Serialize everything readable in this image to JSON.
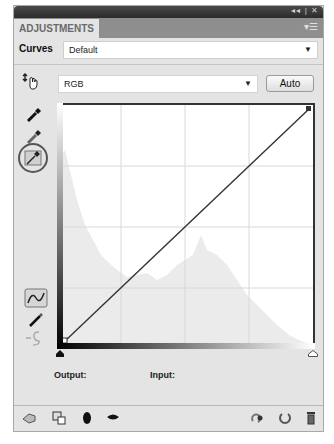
{
  "window": {
    "controls": "◂◂ | ✕"
  },
  "tabs": [
    {
      "label": "ADJUSTMENTS",
      "active": true
    }
  ],
  "tab_menu_icon": "▾☰",
  "preset": {
    "label": "Curves",
    "value": "Default"
  },
  "channel": {
    "value": "RGB"
  },
  "auto_button": {
    "label": "Auto"
  },
  "tools": [
    {
      "name": "on-image-adjust-hand-icon"
    },
    {
      "name": "black-point-eyedropper-icon"
    },
    {
      "name": "gray-point-eyedropper-icon"
    },
    {
      "name": "white-point-eyedropper-icon",
      "selected": true
    },
    {
      "name": "edit-points-curve-icon",
      "selected": true
    },
    {
      "name": "draw-pencil-icon"
    },
    {
      "name": "smooth-curve-icon",
      "disabled": true
    }
  ],
  "curve": {
    "start": [
      0,
      0
    ],
    "end": [
      255,
      255
    ],
    "grid_divisions": 4
  },
  "labels": {
    "output": "Output:",
    "input": "Input:"
  },
  "footer_icons": [
    "back-arrow-icon",
    "clip-to-layer-icon",
    "visibility-toggle-icon",
    "view-previous-state-icon",
    "reset-icon",
    "delete-icon"
  ],
  "colors": {
    "panel_bg": "#e4e4e4",
    "titlebar": "#2b2b2b",
    "tabrow": "#8e8e8e",
    "curve_line": "#333333",
    "histogram": "#ebebeb"
  }
}
